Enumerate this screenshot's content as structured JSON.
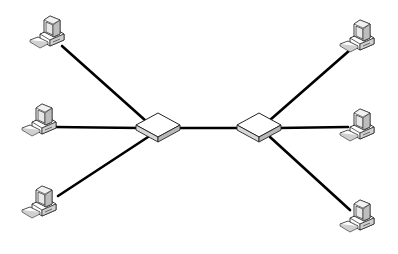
{
  "diagram": {
    "type": "network-topology",
    "switches": [
      {
        "id": "switch-left",
        "cx": 158,
        "cy": 128
      },
      {
        "id": "switch-right",
        "cx": 259,
        "cy": 128
      }
    ],
    "computers": [
      {
        "id": "pc-left-top",
        "x": 50,
        "y": 32,
        "connects_to": "switch-left"
      },
      {
        "id": "pc-left-middle",
        "x": 42,
        "y": 120,
        "connects_to": "switch-left"
      },
      {
        "id": "pc-left-bottom",
        "x": 42,
        "y": 202,
        "connects_to": "switch-left"
      },
      {
        "id": "pc-right-top",
        "x": 360,
        "y": 36,
        "connects_to": "switch-right"
      },
      {
        "id": "pc-right-middle",
        "x": 360,
        "y": 125,
        "connects_to": "switch-right"
      },
      {
        "id": "pc-right-bottom",
        "x": 360,
        "y": 216,
        "connects_to": "switch-right"
      }
    ],
    "links": [
      {
        "from": "pc-left-top",
        "to": "switch-left",
        "x1": 62,
        "y1": 46,
        "x2": 146,
        "y2": 121
      },
      {
        "from": "pc-left-middle",
        "to": "switch-left",
        "x1": 54,
        "y1": 127,
        "x2": 140,
        "y2": 128
      },
      {
        "from": "pc-left-bottom",
        "to": "switch-left",
        "x1": 58,
        "y1": 196,
        "x2": 148,
        "y2": 137
      },
      {
        "from": "switch-left",
        "to": "switch-right",
        "x1": 178,
        "y1": 128,
        "x2": 240,
        "y2": 128
      },
      {
        "from": "switch-right",
        "to": "pc-right-top",
        "x1": 270,
        "y1": 120,
        "x2": 350,
        "y2": 50
      },
      {
        "from": "switch-right",
        "to": "pc-right-middle",
        "x1": 278,
        "y1": 128,
        "x2": 348,
        "y2": 127
      },
      {
        "from": "switch-right",
        "to": "pc-right-bottom",
        "x1": 270,
        "y1": 137,
        "x2": 350,
        "y2": 210
      }
    ],
    "colors": {
      "line": "#000000",
      "device_fill": "#ffffff",
      "device_shade": "#d8d8d8",
      "device_outline": "#222222",
      "background": "#ffffff"
    }
  }
}
